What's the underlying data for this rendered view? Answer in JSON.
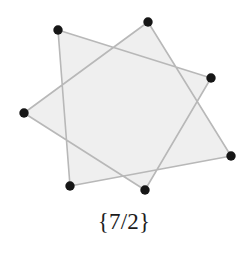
{
  "figure": {
    "caption": "{7/2}",
    "name": "heptagram",
    "schlafli_numerator": 7,
    "schlafli_denominator": 2,
    "background_color": "#ffffff",
    "fill_color": "#efefef",
    "stroke_color": "#b8b8b8",
    "vertex_color": "#161616",
    "stroke_width": 1.6,
    "vertex_radius": 4.7,
    "center": {
      "x": 128,
      "y": 106
    },
    "circumradius": 87,
    "start_angle_deg": -77,
    "vertices": [
      {
        "id": "v0",
        "label": "top",
        "x": 148,
        "y": 22
      },
      {
        "id": "v1",
        "label": "upper-right",
        "x": 211,
        "y": 78
      },
      {
        "id": "v2",
        "label": "lower-right",
        "x": 231,
        "y": 156
      },
      {
        "id": "v3",
        "label": "bottom-center",
        "x": 145,
        "y": 190
      },
      {
        "id": "v4",
        "label": "bottom-left",
        "x": 70,
        "y": 186
      },
      {
        "id": "v5",
        "label": "left",
        "x": 24,
        "y": 113
      },
      {
        "id": "v6",
        "label": "upper-left",
        "x": 58,
        "y": 30
      }
    ],
    "path_order": [
      0,
      2,
      4,
      6,
      1,
      3,
      5
    ],
    "edges": [
      {
        "from": "v0",
        "to": "v2"
      },
      {
        "from": "v2",
        "to": "v4"
      },
      {
        "from": "v4",
        "to": "v6"
      },
      {
        "from": "v6",
        "to": "v1"
      },
      {
        "from": "v1",
        "to": "v3"
      },
      {
        "from": "v3",
        "to": "v5"
      },
      {
        "from": "v5",
        "to": "v0"
      }
    ]
  }
}
